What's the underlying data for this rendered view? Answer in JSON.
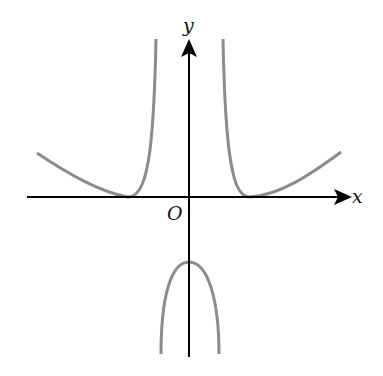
{
  "diagram": {
    "type": "function-graph",
    "axes": {
      "x_label": "x",
      "y_label": "y",
      "origin_label": "O"
    },
    "colors": {
      "axes": "#000000",
      "curve": "#8c8c8c",
      "background": "#ffffff"
    },
    "curves": [
      {
        "name": "left-branch",
        "description": "Decreasing from upper-left, touches x-axis at a minimum, then rises steeply to a vertical asymptote left of the y-axis"
      },
      {
        "name": "right-branch",
        "description": "Descends from a vertical asymptote right of the y-axis, touches x-axis at a minimum, then rises to upper-right"
      },
      {
        "name": "middle-branch",
        "description": "Downward-opening arch with maximum on the negative y-axis, between the two asymptotes"
      }
    ]
  }
}
